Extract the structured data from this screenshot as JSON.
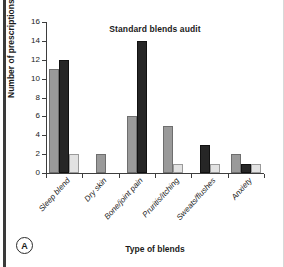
{
  "panel": {
    "letter": "A"
  },
  "chart_data": {
    "type": "bar",
    "title": "Standard blends audit",
    "xlabel": "Type of blends",
    "ylabel": "Number of prescriptions",
    "ylim": [
      0,
      16
    ],
    "yticks": [
      0,
      2,
      4,
      6,
      8,
      10,
      12,
      14,
      16
    ],
    "grid": false,
    "legend": "none",
    "categories": [
      "Sleep blend",
      "Dry skin",
      "Bone/joint pain",
      "Pruritis/itching",
      "Sweats/flushes",
      "Anxiety"
    ],
    "series": [
      {
        "name": "series-1",
        "color": "#9a9a9a",
        "values": [
          11,
          2,
          6,
          5,
          0,
          2
        ]
      },
      {
        "name": "series-2",
        "color": "#262626",
        "values": [
          12,
          0,
          14,
          0,
          3,
          1
        ]
      },
      {
        "name": "series-3",
        "color": "#e2e2e2",
        "values": [
          2,
          0,
          0,
          1,
          1,
          1
        ]
      }
    ]
  }
}
